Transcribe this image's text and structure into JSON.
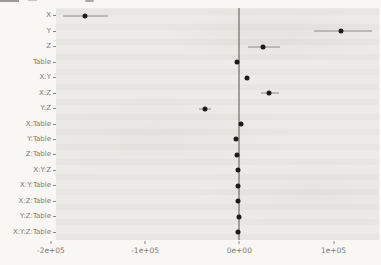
{
  "chart_data": {
    "type": "scatter",
    "subtype": "horizontal dot plot with error bars (coefficient / forest plot)",
    "title": "",
    "xlabel": "",
    "ylabel": "",
    "legend": "none",
    "grid": "off",
    "categories": [
      "X",
      "Y",
      "Z",
      "Table",
      "X:Y",
      "X:Z",
      "Y:Z",
      "X:Table",
      "Y:Table",
      "Z:Table",
      "X:Y:Z",
      "X:Y:Table",
      "X:Z:Table",
      "Y:Z:Table",
      "X:Y:Z:Table"
    ],
    "estimates": [
      -164000,
      108000,
      25000,
      -2000,
      8000,
      32000,
      -36000,
      2000,
      -3000,
      -2000,
      -1000,
      -1000,
      -1000,
      0,
      -1000
    ],
    "ci_low": [
      -187000,
      79000,
      9000,
      -2000,
      8000,
      23000,
      -43000,
      2000,
      -3000,
      -2000,
      -1000,
      -1000,
      -1000,
      0,
      -1000
    ],
    "ci_high": [
      -139000,
      141000,
      43000,
      -2000,
      8000,
      42000,
      -30000,
      2000,
      -3000,
      -2000,
      -1000,
      -1000,
      -1000,
      0,
      -1000
    ],
    "x_ticks": [
      -200000,
      -100000,
      0,
      100000
    ],
    "x_tick_labels": [
      "-2e+05",
      "-1e+05",
      "0e+00",
      "1e+05"
    ],
    "xlim": [
      -194600,
      148300
    ],
    "vline_at": 0,
    "colors": {
      "point": "#1c1c1c",
      "error_bar": "#8c8a86",
      "zero_line": "#57544f",
      "panel_bg": "#eceae7",
      "text": "#7d7a75",
      "axis_tick": "#8a8783"
    }
  }
}
